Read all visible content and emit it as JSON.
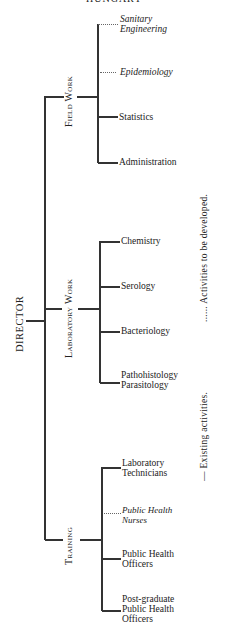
{
  "title": "HUNGARY",
  "root": {
    "label": "DIRECTOR"
  },
  "groups": [
    {
      "label": "Field Work",
      "items": [
        {
          "line1": "Sanitary",
          "line2": "Engineering",
          "status": "to-be-developed"
        },
        {
          "line1": "Epidemiology",
          "line2": "",
          "status": "to-be-developed"
        },
        {
          "line1": "Statistics",
          "line2": "",
          "status": "existing"
        },
        {
          "line1": "Administration",
          "line2": "",
          "status": "existing"
        }
      ]
    },
    {
      "label": "Laboratory Work",
      "items": [
        {
          "line1": "Chemistry",
          "line2": "",
          "status": "existing"
        },
        {
          "line1": "Serology",
          "line2": "",
          "status": "existing"
        },
        {
          "line1": "Bacteriology",
          "line2": "",
          "status": "existing"
        },
        {
          "line1": "Pathohistology",
          "line2": "Parasitology",
          "status": "existing"
        }
      ]
    },
    {
      "label": "Training",
      "items": [
        {
          "line1": "Laboratory",
          "line2": "Technicians",
          "status": "existing"
        },
        {
          "line1": "Public Health",
          "line2": "Nurses",
          "status": "to-be-developed"
        },
        {
          "line1": "Public Health",
          "line2": "Officers",
          "status": "existing"
        },
        {
          "line1": "Post-graduate",
          "line2": "Public Health",
          "line3": "Officers",
          "status": "existing"
        }
      ]
    }
  ],
  "legend": {
    "developed": "...... Activities to be developed.",
    "existing": "— Existing activities."
  }
}
